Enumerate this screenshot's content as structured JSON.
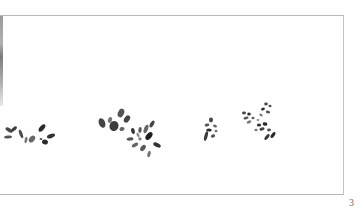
{
  "page": {
    "page_number": "3",
    "frame_color": "#b9b9b9",
    "ink_color": "#2e2e2e"
  },
  "illustration": {
    "description": "ink-wash brush-stroke foliage clusters",
    "clusters": [
      {
        "name": "leaf-cluster-1",
        "x": 28,
        "y": 133
      },
      {
        "name": "leaf-cluster-2",
        "x": 117,
        "y": 121
      },
      {
        "name": "leaf-cluster-3",
        "x": 143,
        "y": 139
      },
      {
        "name": "leaf-cluster-4",
        "x": 211,
        "y": 128
      },
      {
        "name": "leaf-cluster-5",
        "x": 259,
        "y": 122
      }
    ]
  }
}
